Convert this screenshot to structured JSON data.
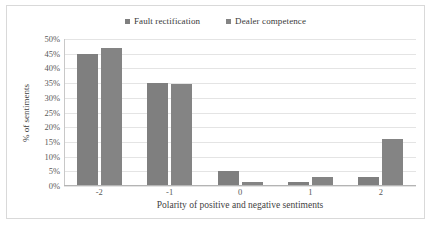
{
  "chart_data": {
    "type": "bar",
    "title": "",
    "categories": [
      "-2",
      "-1",
      "0",
      "1",
      "2"
    ],
    "series": [
      {
        "name": "Fault rectification",
        "color": "#7f7f7f",
        "values": [
          45,
          35,
          5,
          1.5,
          3
        ]
      },
      {
        "name": "Dealer competence",
        "color": "#848484",
        "values": [
          47,
          34.6,
          1.5,
          3,
          16
        ]
      }
    ],
    "xlabel": "Polarity of positive and negative sentiments",
    "ylabel": "% of sentiments",
    "ylim": [
      0,
      50
    ],
    "ytick_step": 5,
    "ytick_labels": [
      "50%",
      "45%",
      "40%",
      "35%",
      "30%",
      "25%",
      "20%",
      "15%",
      "10%",
      "5%",
      "0%"
    ],
    "ytick_values": [
      50,
      45,
      40,
      35,
      30,
      25,
      20,
      15,
      10,
      5,
      0
    ],
    "grid": "horizontal",
    "legend_position": "top-center",
    "legend_marker": "square",
    "frame_color": "#d9d9d9",
    "gridline_color": "#e4e4e4"
  }
}
